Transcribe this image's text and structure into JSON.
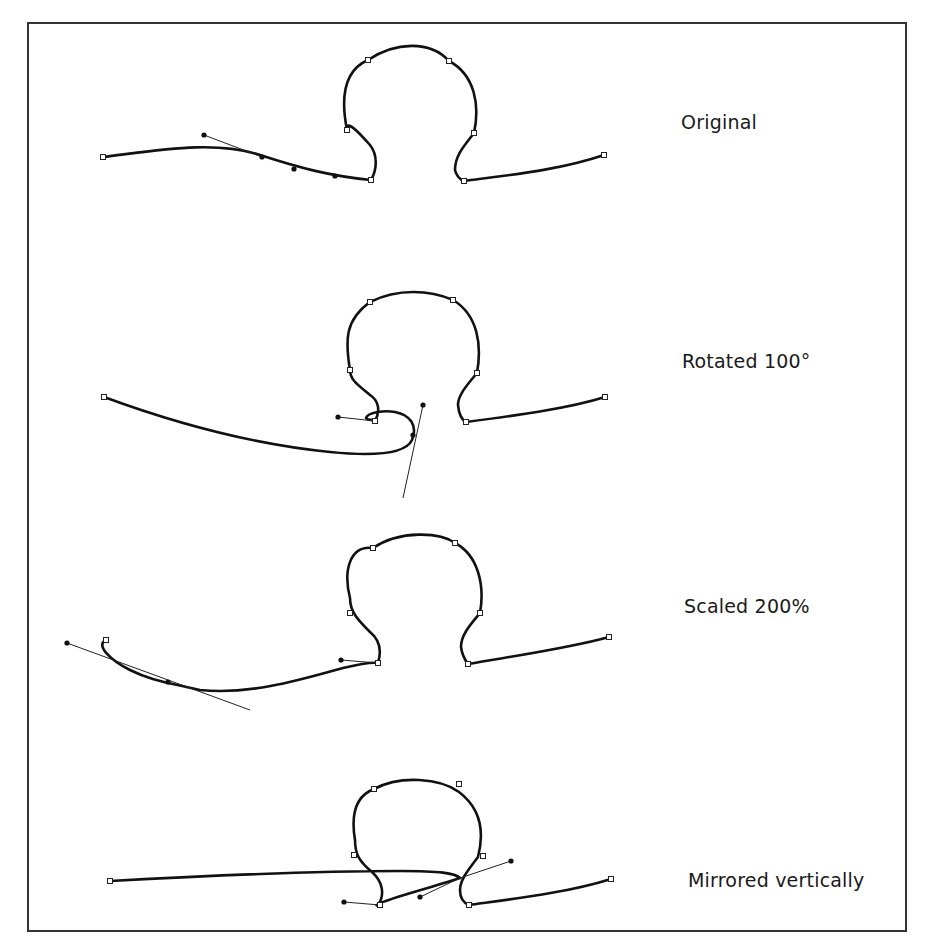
{
  "figure": {
    "panels": [
      {
        "id": "original",
        "label": "Original",
        "label_pos": [
          681,
          119
        ],
        "path": "M103,157 C160,150 215,140 260,155 C300,168 330,176 371,180 C377,170 378,155 370,145 C355,128 346,120 347,130 C340,95 345,70 368,60 C395,42 430,40 449,61 C475,75 480,105 474,133 C465,145 455,155 455,170 C456,175 460,180 464,181 C510,175 560,170 604,155",
        "anchors": [
          [
            103,
            157
          ],
          [
            371,
            180
          ],
          [
            347,
            130
          ],
          [
            368,
            60
          ],
          [
            449,
            61
          ],
          [
            474,
            133
          ],
          [
            464,
            181
          ],
          [
            604,
            155
          ]
        ],
        "handles": [
          {
            "from": [
              204,
              135
            ],
            "to": [
              262,
              157
            ]
          }
        ],
        "on_curve_dots": [
          [
            262,
            157
          ],
          [
            294,
            169
          ],
          [
            335,
            176
          ]
        ]
      },
      {
        "id": "rotated",
        "label": "Rotated 100°",
        "label_pos": [
          682,
          358
        ],
        "path": "M104,397 C180,425 260,445 330,452 C370,456 405,455 412,440 C418,425 410,415 395,412 C385,410 368,412 366,418 C368,421 372,419 375,421 C381,410 378,400 370,395 C358,385 350,380 350,370 C345,340 345,320 370,302 C398,288 430,290 453,300 C478,315 482,345 477,373 C467,385 458,395 458,405 C459,415 462,420 466,422 C520,415 570,408 605,397",
        "anchors": [
          [
            104,
            397
          ],
          [
            375,
            421
          ],
          [
            350,
            370
          ],
          [
            370,
            302
          ],
          [
            453,
            300
          ],
          [
            477,
            373
          ],
          [
            466,
            422
          ],
          [
            605,
            397
          ]
        ],
        "handles": [
          {
            "from": [
              338,
              417
            ],
            "to": [
              375,
              421
            ]
          },
          {
            "from": [
              423,
              405
            ],
            "to": [
              403,
              498
            ]
          }
        ],
        "on_curve_dots": [
          [
            413,
            435
          ]
        ]
      },
      {
        "id": "scaled",
        "label": "Scaled 200%",
        "label_pos": [
          684,
          603
        ],
        "path": "M106,640 C95,645 110,660 130,670 C150,680 165,682 200,690 C250,695 300,680 343,668 C360,664 372,662 378,663 C382,650 380,640 370,632 C358,620 350,612 350,598 C343,570 350,545 373,548 C400,530 440,532 455,543 C478,555 485,585 480,613 C470,625 461,635 461,647 C462,655 465,660 468,664 C520,655 570,648 609,637",
        "anchors": [
          [
            106,
            640
          ],
          [
            378,
            663
          ],
          [
            350,
            613
          ],
          [
            373,
            548
          ],
          [
            455,
            543
          ],
          [
            480,
            613
          ],
          [
            468,
            664
          ],
          [
            609,
            637
          ]
        ],
        "handles": [
          {
            "from": [
              67,
              643
            ],
            "to": [
              250,
              710
            ]
          },
          {
            "from": [
              341,
              660
            ],
            "to": [
              378,
              663
            ]
          }
        ],
        "on_curve_dots": [
          [
            168,
            682
          ]
        ]
      },
      {
        "id": "mirrored",
        "label": "Mirrored vertically",
        "label_pos": [
          688,
          877
        ],
        "path": "M110,881 C220,875 320,871 400,871 C440,871 455,873 460,878 C440,885 400,895 380,903 C377,905 375,906 378,905 C385,895 383,882 372,872 C360,862 355,855 355,840 C350,810 358,795 374,789 C400,775 440,778 459,792 C480,808 485,830 478,857 C468,870 460,880 460,890 C460,898 464,903 469,905 C520,898 570,892 611,879",
        "anchors": [
          [
            110,
            881
          ],
          [
            380,
            905
          ],
          [
            354,
            855
          ],
          [
            374,
            789
          ],
          [
            459,
            784
          ],
          [
            483,
            856
          ],
          [
            469,
            905
          ],
          [
            611,
            879
          ]
        ],
        "handles": [
          {
            "from": [
              344,
              902
            ],
            "to": [
              380,
              905
            ]
          },
          {
            "from": [
              511,
              861
            ],
            "to": [
              460,
              878
            ]
          },
          {
            "from": [
              420,
              897
            ],
            "to": [
              460,
              878
            ]
          }
        ],
        "on_curve_dots": []
      }
    ]
  }
}
